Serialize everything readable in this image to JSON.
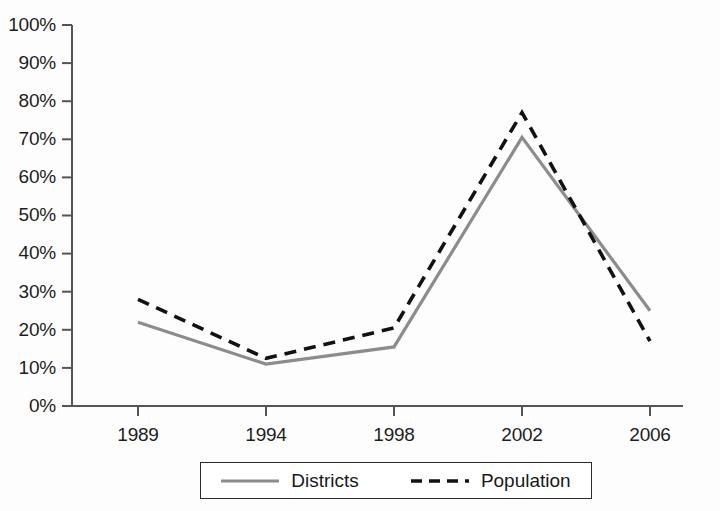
{
  "chart_data": {
    "type": "line",
    "title": "",
    "subtitle": "",
    "xlabel": "",
    "ylabel": "",
    "x": [
      1989,
      1994,
      1998,
      2002,
      2006
    ],
    "categories": [
      "1989",
      "1994",
      "1998",
      "2002",
      "2006"
    ],
    "series": [
      {
        "name": "Districts",
        "values": [
          22,
          11,
          15.5,
          70.5,
          25
        ],
        "style": "solid",
        "color": "#8c8c8c"
      },
      {
        "name": "Population",
        "values": [
          28,
          12.5,
          20.5,
          77,
          17
        ],
        "style": "dashed",
        "color": "#121212"
      }
    ],
    "ylim": [
      0,
      100
    ],
    "ytick_values": [
      0,
      10,
      20,
      30,
      40,
      50,
      60,
      70,
      80,
      90,
      100
    ],
    "ytick_labels": [
      "0%",
      "10%",
      "20%",
      "30%",
      "40%",
      "50%",
      "60%",
      "70%",
      "80%",
      "90%",
      "100%"
    ],
    "xtick_labels": [
      "1989",
      "1994",
      "1998",
      "2002",
      "2006"
    ],
    "grid": false,
    "legend_position": "bottom-center",
    "value_unit": "percent"
  },
  "legend": {
    "entries": [
      {
        "label": "Districts",
        "icon": "solid-line-swatch"
      },
      {
        "label": "Population",
        "icon": "dashed-line-swatch"
      }
    ]
  },
  "colors": {
    "districts_line": "#8c8c8c",
    "population_line": "#121212",
    "axis": "#4a4a4a",
    "text": "#1a1a1a",
    "background": "#fdfdfd",
    "legend_border": "#2b2b2b"
  }
}
